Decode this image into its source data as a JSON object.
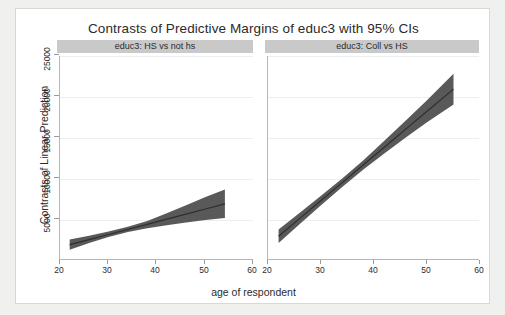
{
  "chart_data": {
    "type": "line",
    "title": "Contrasts of Predictive Margins of educ3 with 95% CIs",
    "xlabel": "age of respondent",
    "ylabel": "Contrasts of Linear Prediction",
    "xlim": [
      20,
      60
    ],
    "ylim": [
      2500,
      26500
    ],
    "xticks": [
      20,
      30,
      40,
      50,
      60
    ],
    "yticks": [
      5000,
      10000,
      15000,
      20000,
      25000
    ],
    "grid": true,
    "legend": "none",
    "panels": [
      {
        "label": "educ3: HS vs not hs",
        "x": [
          22,
          26,
          30,
          34,
          38,
          42,
          46,
          50,
          54
        ],
        "estimate": [
          4300,
          4900,
          5500,
          6100,
          6700,
          7300,
          7900,
          8500,
          9100
        ],
        "ci_lower": [
          3700,
          4500,
          5200,
          5800,
          6250,
          6600,
          6900,
          7200,
          7450
        ],
        "ci_upper": [
          4900,
          5350,
          5850,
          6400,
          7100,
          8000,
          8950,
          9900,
          10800
        ]
      },
      {
        "label": "educ3: Coll vs HS",
        "x": [
          22,
          26,
          30,
          34,
          38,
          42,
          46,
          50,
          55
        ],
        "estimate": [
          5300,
          7400,
          9500,
          11600,
          13700,
          15800,
          17900,
          20000,
          22600
        ],
        "ci_lower": [
          4500,
          6750,
          8950,
          11100,
          13150,
          15050,
          16900,
          18700,
          20800
        ],
        "ci_upper": [
          6100,
          8050,
          10050,
          12100,
          14250,
          16550,
          18900,
          21300,
          24400
        ]
      }
    ]
  },
  "figure": {
    "title": "Contrasts of Predictive Margins of educ3 with 95% CIs",
    "ylabel": "Contrasts of Linear Prediction",
    "xlabel": "age of respondent",
    "yticks": [
      "25000",
      "20000",
      "15000",
      "10000",
      "5000"
    ],
    "xticks_left": [
      "20",
      "30",
      "40",
      "50",
      "60"
    ],
    "xticks_right": [
      "20",
      "30",
      "40",
      "50",
      "60"
    ],
    "panel_left_label": "educ3: HS vs not hs",
    "panel_right_label": "educ3: Coll vs HS",
    "colors": {
      "band": "#595959",
      "line": "#2f2f2f",
      "header": "#c9c9c9",
      "grid": "#eceff1",
      "axis": "#b6b6b6",
      "background": "#ffffff",
      "page": "#f0f0ee"
    }
  }
}
